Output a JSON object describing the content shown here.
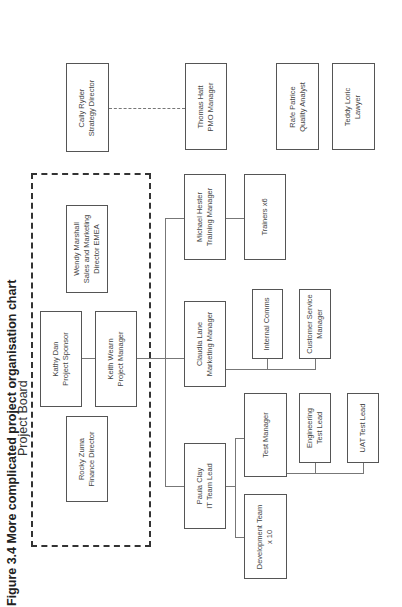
{
  "title": "Figure 3.4 More complicated project organisation chart",
  "board": {
    "label": "Project Board"
  },
  "nodes": {
    "wendy": {
      "name": "Wendy Marshall",
      "role": "Sales and Marketing",
      "role2": "Director EMEA"
    },
    "kathy": {
      "name": "Kathy Dan",
      "role": "Project Sponsor"
    },
    "keith": {
      "name": "Keith Wearn",
      "role": "Project Manager"
    },
    "rocky": {
      "name": "Rocky Zuma",
      "role": "Finance Director"
    },
    "cally": {
      "name": "Cally Ryder",
      "role": "Strategy Director"
    },
    "thomas": {
      "name": "Thomas Hatt",
      "role": "PMO Manager"
    },
    "rafe": {
      "name": "Rafe Patrice",
      "role": "Quality Analyst"
    },
    "teddy": {
      "name": "Teddy Loric",
      "role": "Lawyer"
    },
    "michael": {
      "name": "Michael Hester",
      "role": "Training Manager"
    },
    "trainers": {
      "name": "Trainers  x6"
    },
    "claudia": {
      "name": "Claudia Lane",
      "role": "Marketing Manager"
    },
    "comms": {
      "name": "Internal Comms"
    },
    "csm": {
      "name": "Customer Service",
      "role": "Manager"
    },
    "paula": {
      "name": "Paula Clay",
      "role": "IT Team Lead"
    },
    "testmgr": {
      "name": "Test Manager"
    },
    "engtest": {
      "name": "Engineering",
      "role": "Test Lead"
    },
    "uat": {
      "name": "UAT Test Lead"
    },
    "devteam": {
      "name": "Development Team",
      "role": "x 10"
    }
  }
}
